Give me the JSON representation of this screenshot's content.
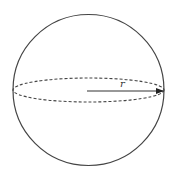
{
  "diagram": {
    "type": "sphere-with-radius",
    "sphere": {
      "cx": 88.5,
      "cy": 90,
      "r": 75.5,
      "stroke": "#444444"
    },
    "equator": {
      "rx": 75.5,
      "ry": 12,
      "style": "dashed",
      "stroke": "#444444"
    },
    "radius_arrow": {
      "label": "r",
      "from": [
        87,
        91
      ],
      "to": [
        163,
        91
      ],
      "stroke": "#333333"
    }
  }
}
